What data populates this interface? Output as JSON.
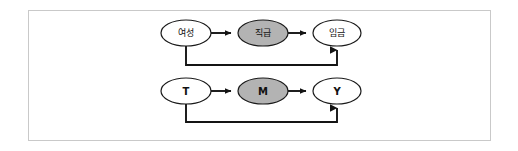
{
  "figure": {
    "background_color": "#ffffff",
    "frame": {
      "x": 28,
      "y": 10,
      "width": 463,
      "height": 131,
      "border_color": "#c9c9c9"
    },
    "colors": {
      "node_fill_plain": "#ffffff",
      "node_fill_shaded": "#b3b3b3",
      "node_stroke": "#1a1a1a",
      "edge_color": "#141414",
      "label_color": "#111111"
    }
  },
  "diagram": {
    "type": "path-diagram",
    "rows": [
      {
        "id": "row-concrete",
        "center_y": 33,
        "feedback_y": 65,
        "nodes": [
          {
            "id": "node-yeoseong",
            "role": "treatment",
            "label": "여성",
            "script": "korean",
            "cx": 186,
            "cy": 33,
            "rx": 25,
            "ry": 13,
            "shaded": false
          },
          {
            "id": "node-jikgeup",
            "role": "mediator",
            "label": "직급",
            "script": "korean",
            "cx": 263,
            "cy": 33,
            "rx": 25,
            "ry": 13,
            "shaded": true
          },
          {
            "id": "node-imgeum",
            "role": "outcome",
            "label": "임금",
            "script": "korean",
            "cx": 337,
            "cy": 33,
            "rx": 24,
            "ry": 13,
            "shaded": false
          }
        ],
        "edges": [
          {
            "id": "edge-yeoseong-jikgeup",
            "from": "node-yeoseong",
            "to": "node-jikgeup",
            "kind": "direct-arrow"
          },
          {
            "id": "edge-jikgeup-imgeum",
            "from": "node-jikgeup",
            "to": "node-imgeum",
            "kind": "direct-arrow"
          },
          {
            "id": "edge-yeoseong-imgeum",
            "from": "node-yeoseong",
            "to": "node-imgeum",
            "kind": "bypass-arrow"
          }
        ]
      },
      {
        "id": "row-abstract",
        "center_y": 91,
        "feedback_y": 122,
        "nodes": [
          {
            "id": "node-t",
            "role": "treatment",
            "label": "T",
            "script": "latin",
            "cx": 186,
            "cy": 91,
            "rx": 25,
            "ry": 13,
            "shaded": false
          },
          {
            "id": "node-m",
            "role": "mediator",
            "label": "M",
            "script": "latin",
            "cx": 263,
            "cy": 91,
            "rx": 25,
            "ry": 13,
            "shaded": true
          },
          {
            "id": "node-y",
            "role": "outcome",
            "label": "Y",
            "script": "latin",
            "cx": 337,
            "cy": 91,
            "rx": 24,
            "ry": 13,
            "shaded": false
          }
        ],
        "edges": [
          {
            "id": "edge-t-m",
            "from": "node-t",
            "to": "node-m",
            "kind": "direct-arrow"
          },
          {
            "id": "edge-m-y",
            "from": "node-m",
            "to": "node-y",
            "kind": "direct-arrow"
          },
          {
            "id": "edge-t-y",
            "from": "node-t",
            "to": "node-y",
            "kind": "bypass-arrow"
          }
        ]
      }
    ]
  }
}
